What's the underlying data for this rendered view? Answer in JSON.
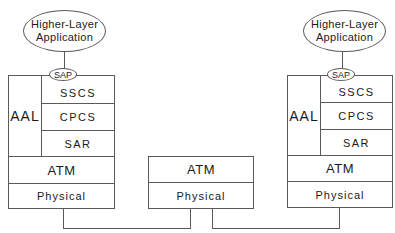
{
  "left_stack": {
    "application": {
      "line1": "Higher-Layer",
      "line2": "Application"
    },
    "sap": "SAP",
    "aal": "AAL",
    "sublayers": [
      "SSCS",
      "CPCS",
      "SAR"
    ],
    "atm": "ATM",
    "physical": "Physical"
  },
  "middle_stack": {
    "atm": "ATM",
    "physical": "Physical"
  },
  "right_stack": {
    "application": {
      "line1": "Higher-Layer",
      "line2": "Application"
    },
    "sap": "SAP",
    "aal": "AAL",
    "sublayers": [
      "SSCS",
      "CPCS",
      "SAR"
    ],
    "atm": "ATM",
    "physical": "Physical"
  }
}
